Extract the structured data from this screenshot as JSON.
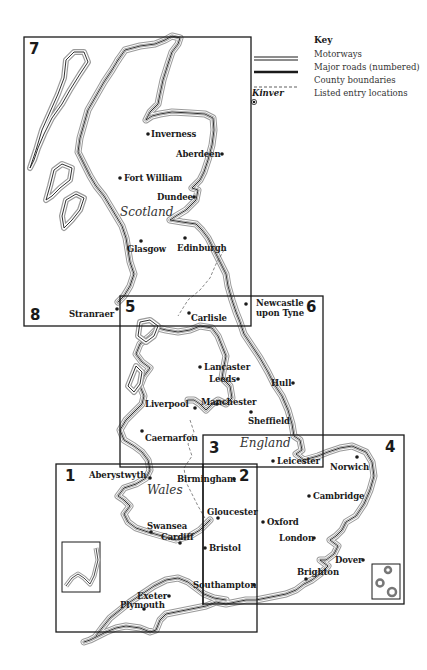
{
  "key": {
    "title": "Key",
    "items": [
      {
        "symbol": "double-line",
        "label": "Motorways"
      },
      {
        "symbol": "thick-line",
        "label": "Major roads (numbered)"
      },
      {
        "symbol": "dashed-line",
        "label": "County boundaries"
      },
      {
        "symbol": "dot-marker",
        "sample": "Kinver",
        "label": "Listed entry locations"
      }
    ]
  },
  "regions": {
    "scotland": "Scotland",
    "england": "England",
    "wales": "Wales"
  },
  "boxes": [
    {
      "number": "1"
    },
    {
      "number": "2"
    },
    {
      "number": "3"
    },
    {
      "number": "4"
    },
    {
      "number": "5"
    },
    {
      "number": "6"
    },
    {
      "number": "7"
    },
    {
      "number": "8"
    }
  ],
  "places": {
    "inverness": "Inverness",
    "aberdeen": "Aberdeen",
    "fort_william": "Fort William",
    "dundee": "Dundee",
    "glasgow": "Glasgow",
    "edinburgh": "Edinburgh",
    "stranraer": "Stranraer",
    "carlisle": "Carlisle",
    "newcastle_1": "Newcastle",
    "newcastle_2": "upon Tyne",
    "lancaster": "Lancaster",
    "leeds": "Leeds",
    "hull": "Hull",
    "liverpool": "Liverpool",
    "manchester": "Manchester",
    "sheffield": "Sheffield",
    "caernarfon": "Caernarfon",
    "leicester": "Leicester",
    "norwich": "Norwich",
    "aberystwyth": "Aberystwyth",
    "birmingham": "Birmingham",
    "cambridge": "Cambridge",
    "gloucester": "Gloucester",
    "oxford": "Oxford",
    "swansea": "Swansea",
    "cardiff": "Cardiff",
    "bristol": "Bristol",
    "london": "London",
    "dover": "Dover",
    "brighton": "Brighton",
    "southampton": "Southampton",
    "exeter": "Exeter",
    "plymouth": "Plymouth"
  },
  "colors": {
    "ink": "#1a1a1a",
    "coast_halo": "#9a9a9a",
    "background": "#ffffff"
  }
}
